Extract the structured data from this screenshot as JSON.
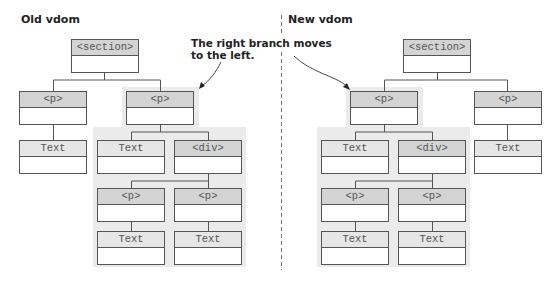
{
  "titles": {
    "old": "Old vdom",
    "new": "New vdom"
  },
  "annotation": {
    "line1": "The right branch moves",
    "line2": "to the left."
  },
  "colors": {
    "highlight": "#ebebeb",
    "element_header": "#d4d4d4",
    "text_header": "#e6e6e6",
    "border": "#555555"
  },
  "old_tree": {
    "section": "<section>",
    "left_p": "<p>",
    "left_text": "Text",
    "right_p": "<p>",
    "right_text": "Text",
    "div": "<div>",
    "div_p1": "<p>",
    "div_p2": "<p>",
    "div_p1_text": "Text",
    "div_p2_text": "Text"
  },
  "new_tree": {
    "section": "<section>",
    "moved_p": "<p>",
    "moved_text": "Text",
    "div": "<div>",
    "div_p1": "<p>",
    "div_p2": "<p>",
    "div_p1_text": "Text",
    "div_p2_text": "Text",
    "right_p": "<p>",
    "right_text": "Text"
  }
}
